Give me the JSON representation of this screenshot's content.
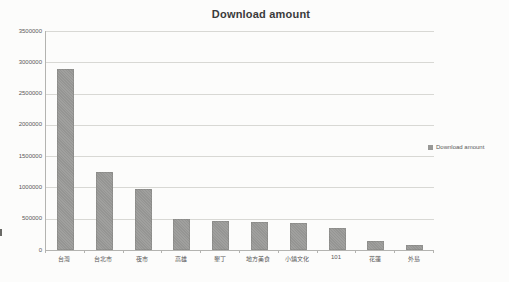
{
  "chart_data": {
    "type": "bar",
    "title": "Download amount",
    "categories": [
      "台灣",
      "台北市",
      "夜市",
      "高雄",
      "墾丁",
      "地方美食",
      "小鎮文化",
      "101",
      "花蓮",
      "外島"
    ],
    "values": [
      2900000,
      1250000,
      980000,
      500000,
      470000,
      450000,
      430000,
      350000,
      150000,
      80000
    ],
    "series_name": "Download amount",
    "xlabel": "",
    "ylabel": "",
    "ylim": [
      0,
      3500000
    ],
    "ytick_step": 500000,
    "ytick_labels": [
      "0",
      "500000",
      "1000000",
      "1500000",
      "2000000",
      "2500000",
      "3000000",
      "3500000"
    ],
    "grid": true,
    "legend_position": "right",
    "bar_color": "#9a9a98",
    "gridline_color": "#d8d8d4",
    "axis_color": "#b3b3b0",
    "label_color": "#595959",
    "title_color": "#3a3a3a"
  },
  "legend": {
    "label": "Download amount",
    "marker_color": "#989896"
  }
}
